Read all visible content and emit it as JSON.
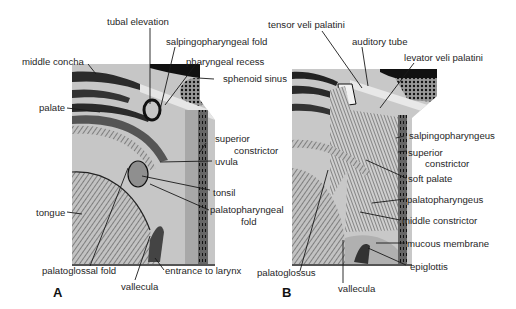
{
  "figure": {
    "panels": [
      {
        "id": "A",
        "letter": "A",
        "labels": {
          "tubal_elevation": "tubal elevation",
          "salpingopharyngeal_fold": "salpingopharyngeal fold",
          "middle_concha": "middle concha",
          "pharyngeal_recess": "pharyngeal recess",
          "sphenoid_sinus": "sphenoid sinus",
          "palate": "palate",
          "superior_constrictor_1": "superior",
          "superior_constrictor_2": "constrictor",
          "uvula": "uvula",
          "tonsil": "tonsil",
          "tongue": "tongue",
          "palatopharyngeal_fold_1": "palatopharyngeal",
          "palatopharyngeal_fold_2": "fold",
          "palatoglossal_fold": "palatoglossal fold",
          "entrance_to_larynx": "entrance to larynx",
          "vallecula": "vallecula"
        }
      },
      {
        "id": "B",
        "letter": "B",
        "labels": {
          "tensor_veli_palatini": "tensor veli palatini",
          "auditory_tube": "auditory tube",
          "levator_veli_palatini": "levator veli palatini",
          "salpingopharyngeus": "salpingopharyngeus",
          "superior_constrictor_1": "superior",
          "superior_constrictor_2": "constrictor",
          "soft_palate": "soft palate",
          "palatopharyngeus": "palatopharyngeus",
          "middle_constrictor": "middle constrictor",
          "mucous_membrane": "mucous membrane",
          "epiglottis": "epiglottis",
          "palatoglossus": "palatoglossus",
          "vallecula": "vallecula"
        }
      }
    ],
    "colors": {
      "tissue_gray": "#b8b8b8",
      "light_gray": "#d4d4d4",
      "dark": "#1a1a1a",
      "background": "#ffffff"
    }
  }
}
